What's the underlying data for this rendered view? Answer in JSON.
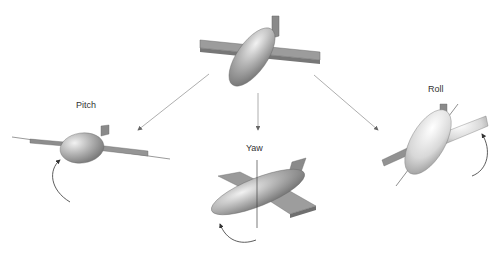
{
  "diagram": {
    "nodes": [
      {
        "id": "center",
        "description": "Aircraft in neutral orientation"
      },
      {
        "id": "pitch",
        "label": "Pitch"
      },
      {
        "id": "yaw",
        "label": "Yaw"
      },
      {
        "id": "roll",
        "label": "Roll"
      }
    ],
    "edges": [
      {
        "from": "center",
        "to": "pitch"
      },
      {
        "from": "center",
        "to": "yaw"
      },
      {
        "from": "center",
        "to": "roll"
      }
    ],
    "colors": {
      "body": "#9a9a9a",
      "wing": "#8f8f8f",
      "arrow": "#888888",
      "axis": "#444444"
    }
  },
  "labels": {
    "pitch": "Pitch",
    "yaw": "Yaw",
    "roll": "Roll"
  }
}
